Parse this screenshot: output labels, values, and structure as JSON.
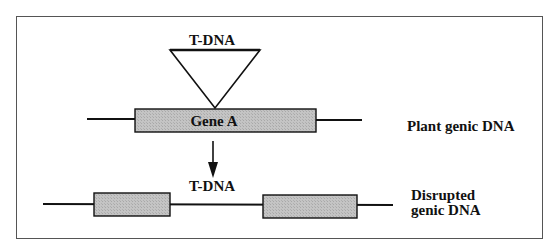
{
  "diagram": {
    "top": {
      "insert_label": "T-DNA",
      "gene_label": "Gene A",
      "row_label": "Plant genic DNA"
    },
    "bottom": {
      "insert_label": "T-DNA",
      "row_label_line1": "Disrupted",
      "row_label_line2": "genic DNA"
    },
    "colors": {
      "frame": "#555555",
      "line": "#111111",
      "gene_fill": "#bcbcbc",
      "background": "#ffffff"
    }
  }
}
